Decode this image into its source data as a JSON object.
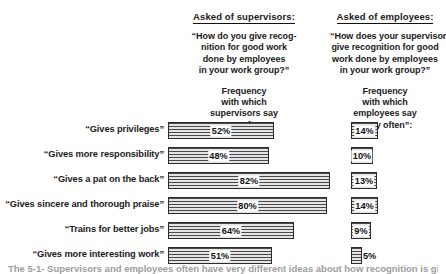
{
  "columns": [
    {
      "id": "supervisors",
      "title": "Asked of supervisors:",
      "question_lines": [
        "“How do you give  recog-",
        "nition for good work",
        "done by  employees",
        "in your work group?”"
      ],
      "frequency_lines": [
        "Frequency",
        "with which",
        "supervisors say",
        "“very often”:"
      ]
    },
    {
      "id": "employees",
      "title": "Asked of employees:",
      "question_lines": [
        "“How does your supervisor",
        "give recognition for good",
        "work done by employees",
        "in your  work group?”"
      ],
      "frequency_lines": [
        "Frequency",
        "with which",
        "employees say",
        "“very often”:"
      ]
    }
  ],
  "chart_data": {
    "type": "bar",
    "orientation": "horizontal",
    "xlabel": "",
    "ylabel": "",
    "xlim": [
      0,
      100
    ],
    "grid": false,
    "legend": "none",
    "units": "percent",
    "categories": [
      "“Gives privileges”",
      "“Gives more responsibility”",
      "“Gives a pat on the back”",
      "“Gives sincere and thorough praise”",
      "“Trains for better jobs”",
      "“Gives more interesting work”"
    ],
    "series": [
      {
        "name": "Frequency with which supervisors say “very often”",
        "values": [
          52,
          48,
          82,
          80,
          64,
          51
        ],
        "labels": [
          "52%",
          "48%",
          "82%",
          "80%",
          "64%",
          "51%"
        ]
      },
      {
        "name": "Frequency with which employees say “very often”",
        "values": [
          14,
          10,
          13,
          14,
          9,
          5
        ],
        "labels": [
          "14%",
          "10%",
          "13%",
          "14%",
          "9%",
          "5%"
        ]
      }
    ]
  },
  "rows": [
    {
      "label": "“Gives privileges”",
      "sup_value": "52%",
      "sup_width": 106,
      "emp_value": "14%",
      "emp_width": 27,
      "emp_label_outside": false
    },
    {
      "label": "“Gives more responsibility”",
      "sup_value": "48%",
      "sup_width": 101,
      "emp_value": "10%",
      "emp_width": 22,
      "emp_label_outside": false
    },
    {
      "label": "“Gives a pat on the back”",
      "sup_value": "82%",
      "sup_width": 162,
      "emp_value": "13%",
      "emp_width": 26,
      "emp_label_outside": false
    },
    {
      "label": "“Gives sincere and thorough praise”",
      "sup_value": "80%",
      "sup_width": 159,
      "emp_value": "14%",
      "emp_width": 27,
      "emp_label_outside": false
    },
    {
      "label": "“Trains for better jobs”",
      "sup_value": "64%",
      "sup_width": 126,
      "emp_value": "9%",
      "emp_width": 20,
      "emp_label_outside": false
    },
    {
      "label": "“Gives more interesting work”",
      "sup_value": "51%",
      "sup_width": 104,
      "emp_value": "5%",
      "emp_width": 11,
      "emp_label_outside": true
    }
  ],
  "caption": "The 5-1-  Supervisors and employees often have very different ideas about how recognition is given"
}
